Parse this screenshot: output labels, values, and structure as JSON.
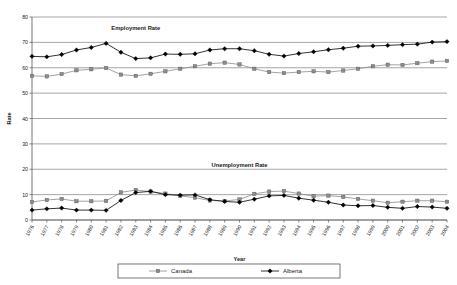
{
  "chart_data": {
    "type": "line",
    "title": "",
    "xlabel": "Year",
    "ylabel": "Rate",
    "ylim": [
      0,
      80
    ],
    "yticks": [
      0,
      10,
      20,
      30,
      40,
      50,
      60,
      70,
      80
    ],
    "grid": true,
    "legend_position": "bottom",
    "categories": [
      "1976",
      "1977",
      "1978",
      "1979",
      "1980",
      "1981",
      "1982",
      "1983",
      "1984",
      "1985",
      "1986",
      "1987",
      "1988",
      "1989",
      "1990",
      "1991",
      "1992",
      "1993",
      "1994",
      "1995",
      "1996",
      "1997",
      "1998",
      "1999",
      "2000",
      "2001",
      "2002",
      "2003",
      "2004"
    ],
    "annotations": [
      {
        "text": "Employment Rate",
        "x": "1983",
        "y": 75
      },
      {
        "text": "Unemployment Rate",
        "x": "1990",
        "y": 21
      }
    ],
    "series": [
      {
        "name": "Canada",
        "measure": "Employment Rate",
        "color": "#8c8c8c",
        "marker": "square",
        "values": [
          56.8,
          56.6,
          57.5,
          59.0,
          59.4,
          59.9,
          57.3,
          56.8,
          57.6,
          58.6,
          59.6,
          60.6,
          61.6,
          62.0,
          61.3,
          59.6,
          58.3,
          57.9,
          58.3,
          58.6,
          58.3,
          58.9,
          59.6,
          60.6,
          61.2,
          61.1,
          61.8,
          62.4,
          62.7
        ]
      },
      {
        "name": "Alberta",
        "measure": "Employment Rate",
        "color": "#000000",
        "marker": "diamond",
        "values": [
          64.5,
          64.3,
          65.2,
          67.0,
          68.0,
          69.6,
          66.1,
          63.6,
          63.9,
          65.4,
          65.3,
          65.5,
          67.0,
          67.5,
          67.5,
          66.7,
          65.3,
          64.6,
          65.6,
          66.3,
          67.1,
          67.7,
          68.5,
          68.6,
          68.8,
          69.1,
          69.3,
          70.1,
          70.3
        ]
      },
      {
        "name": "Canada",
        "measure": "Unemployment Rate",
        "color": "#8c8c8c",
        "marker": "square",
        "values": [
          7.1,
          7.9,
          8.3,
          7.4,
          7.4,
          7.5,
          10.9,
          11.8,
          11.2,
          10.4,
          9.5,
          8.8,
          7.7,
          7.5,
          8.1,
          10.3,
          11.2,
          11.4,
          10.4,
          9.4,
          9.6,
          9.1,
          8.3,
          7.6,
          6.8,
          7.2,
          7.6,
          7.6,
          7.2
        ]
      },
      {
        "name": "Alberta",
        "measure": "Unemployment Rate",
        "color": "#000000",
        "marker": "diamond",
        "values": [
          3.9,
          4.4,
          4.7,
          3.9,
          3.9,
          3.8,
          7.7,
          10.8,
          11.3,
          10.0,
          9.8,
          9.9,
          8.0,
          7.3,
          7.0,
          8.2,
          9.5,
          9.7,
          8.6,
          7.8,
          7.0,
          5.9,
          5.6,
          5.7,
          5.0,
          4.6,
          5.3,
          5.1,
          4.6
        ]
      }
    ],
    "legend": [
      {
        "label": "Canada",
        "color": "#8c8c8c",
        "marker": "square"
      },
      {
        "label": "Alberta",
        "color": "#000000",
        "marker": "diamond"
      }
    ]
  }
}
